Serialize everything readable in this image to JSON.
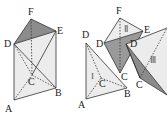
{
  "figure": {
    "left_prism": {
      "labels": {
        "A": "A",
        "B": "B",
        "C": "C",
        "D": "D",
        "E": "E",
        "F": "F"
      }
    },
    "pieces": {
      "I": {
        "numeral": "I",
        "labels": {
          "A": "A",
          "B": "B",
          "C": "C",
          "D": "D"
        }
      },
      "II": {
        "numeral": "Ⅱ",
        "labels": {
          "C": "C",
          "D": "D",
          "E": "E",
          "F": "F"
        }
      },
      "III": {
        "numeral": "Ⅲ",
        "labels": {
          "C": "C",
          "D": "D"
        }
      }
    },
    "colors": {
      "shade_dark": "#8c8c8c",
      "shade_light": "#e6e6e6",
      "line": "#333333"
    }
  }
}
